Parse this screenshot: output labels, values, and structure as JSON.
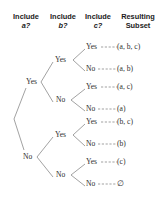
{
  "diagram": {
    "headers": [
      {
        "line1": "Include",
        "line2": "a?",
        "italic2": true
      },
      {
        "line1": "Include",
        "line2": "b?",
        "italic2": true
      },
      {
        "line1": "Include",
        "line2": "c?",
        "italic2": true
      },
      {
        "line1": "Resulting",
        "line2": "Subset",
        "italic2": false
      }
    ],
    "labels": {
      "yes": "Yes",
      "no": "No"
    },
    "level_a": [
      {
        "id": "a-yes",
        "label": "Yes"
      },
      {
        "id": "a-no",
        "label": "No"
      }
    ],
    "level_b": [
      {
        "id": "b-yes-1",
        "label": "Yes"
      },
      {
        "id": "b-no-1",
        "label": "No"
      },
      {
        "id": "b-yes-2",
        "label": "Yes"
      },
      {
        "id": "b-no-2",
        "label": "No"
      }
    ],
    "level_c": [
      {
        "id": "c-1",
        "label": "Yes"
      },
      {
        "id": "c-2",
        "label": "No"
      },
      {
        "id": "c-3",
        "label": "Yes"
      },
      {
        "id": "c-4",
        "label": "No"
      },
      {
        "id": "c-5",
        "label": "Yes"
      },
      {
        "id": "c-6",
        "label": "No"
      },
      {
        "id": "c-7",
        "label": "Yes"
      },
      {
        "id": "c-8",
        "label": "No"
      }
    ],
    "results": [
      {
        "id": "result-1",
        "text": "(a, b, c)"
      },
      {
        "id": "result-2",
        "text": "(a, b)"
      },
      {
        "id": "result-3",
        "text": "(a, c)"
      },
      {
        "id": "result-4",
        "text": "(a)"
      },
      {
        "id": "result-5",
        "text": "(b, c)"
      },
      {
        "id": "result-6",
        "text": "(b)"
      },
      {
        "id": "result-7",
        "text": "(c)"
      },
      {
        "id": "result-8",
        "text": "∅"
      }
    ],
    "colors": {
      "line": "#7a7a7a",
      "text": "#2e2e2e",
      "header": "#1c1c1c",
      "background": "#ffffff"
    }
  }
}
